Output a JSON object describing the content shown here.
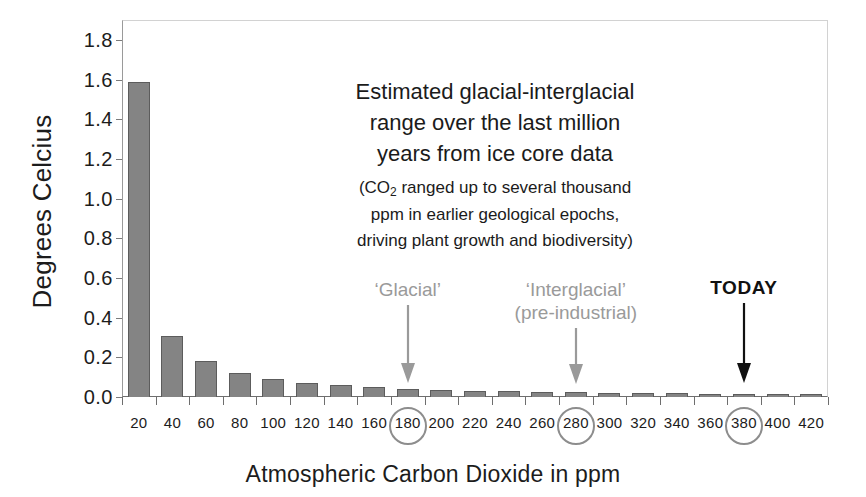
{
  "chart_data": {
    "type": "bar",
    "title": "",
    "xlabel": "Atmospheric Carbon Dioxide in ppm",
    "ylabel": "Degrees Celcius",
    "categories": [
      "20",
      "40",
      "60",
      "80",
      "100",
      "120",
      "140",
      "160",
      "180",
      "200",
      "220",
      "240",
      "260",
      "280",
      "300",
      "320",
      "340",
      "360",
      "380",
      "400",
      "420"
    ],
    "values": [
      1.59,
      0.31,
      0.18,
      0.12,
      0.09,
      0.07,
      0.06,
      0.05,
      0.04,
      0.035,
      0.03,
      0.03,
      0.025,
      0.025,
      0.02,
      0.02,
      0.02,
      0.015,
      0.015,
      0.012,
      0.01
    ],
    "ylim": [
      0.0,
      1.9
    ],
    "yticks": [
      "0.0",
      "0.2",
      "0.4",
      "0.6",
      "0.8",
      "1.0",
      "1.2",
      "1.4",
      "1.6",
      "1.8"
    ],
    "ytick_values": [
      0.0,
      0.2,
      0.4,
      0.6,
      0.8,
      1.0,
      1.2,
      1.4,
      1.6,
      1.8
    ],
    "grid": false,
    "legend": "none",
    "highlighted_categories": [
      "180",
      "280",
      "380"
    ],
    "bar_color": "#848484",
    "bar_edge_color": "#5c5c5c",
    "annotations": [
      {
        "name": "main-note",
        "lines_main": [
          "Estimated glacial-interglacial",
          "range over the last million",
          "years from ice core data"
        ],
        "lines_sub": [
          "(CO2 ranged up to several thousand",
          "ppm in earlier geological epochs,",
          "driving plant growth and biodiversity)"
        ]
      },
      {
        "name": "glacial",
        "label": "'Glacial'",
        "points_to": "180",
        "color": "#9a9a9a"
      },
      {
        "name": "interglacial",
        "label": "'Interglacial'\n(pre-industrial)",
        "points_to": "280",
        "color": "#9a9a9a"
      },
      {
        "name": "today",
        "label": "TODAY",
        "points_to": "380",
        "color": "#111111"
      }
    ]
  },
  "axis": {
    "y_title": "Degrees Celcius",
    "x_title": "Atmospheric Carbon Dioxide in ppm"
  },
  "annotation_text": {
    "line1": "Estimated glacial-interglacial",
    "line2": "range over the last million",
    "line3": "years from ice core data",
    "sub_prefix": "(CO",
    "sub_subscript": "2",
    "sub_line1_rest": " ranged up to several thousand",
    "sub_line2": "ppm in earlier geological epochs,",
    "sub_line3": "driving plant growth and biodiversity)"
  },
  "callouts": {
    "glacial": "‘Glacial’",
    "interglacial_line1": "‘Interglacial’",
    "interglacial_line2": "(pre-industrial)",
    "today": "TODAY"
  }
}
